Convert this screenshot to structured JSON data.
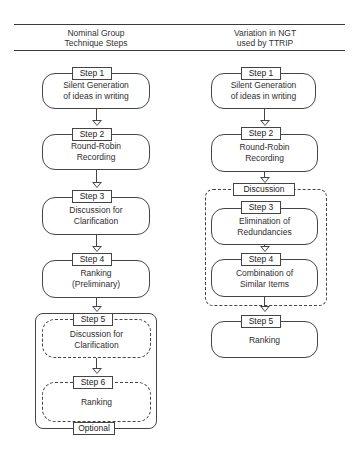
{
  "headers": {
    "left": [
      "Nominal Group",
      "Technique Steps"
    ],
    "right": [
      "Variation in NGT",
      "used by TTRIP"
    ]
  },
  "left_column": {
    "steps": [
      {
        "label": "Step 1",
        "text": [
          "Silent Generation",
          "of ideas in writing"
        ]
      },
      {
        "label": "Step 2",
        "text": [
          "Round-Robin",
          "Recording"
        ]
      },
      {
        "label": "Step 3",
        "text": [
          "Discussion for",
          "Clarification"
        ]
      },
      {
        "label": "Step 4",
        "text": [
          "Ranking",
          "(Preliminary)"
        ]
      },
      {
        "label": "Step 5",
        "text": [
          "Discussion for",
          "Clarification"
        ]
      },
      {
        "label": "Step 6",
        "text": [
          "Ranking"
        ]
      }
    ],
    "group": {
      "label": "Optional",
      "contains": [
        "Step 5",
        "Step 6"
      ]
    }
  },
  "right_column": {
    "steps": [
      {
        "label": "Step 1",
        "text": [
          "Silent Generation",
          "of ideas in writing"
        ]
      },
      {
        "label": "Step 2",
        "text": [
          "Round-Robin",
          "Recording"
        ]
      },
      {
        "label": "Step 3",
        "text": [
          "Elimination of",
          "Redundancies"
        ]
      },
      {
        "label": "Step 4",
        "text": [
          "Combination of",
          "Similar Items"
        ]
      },
      {
        "label": "Step 5",
        "text": [
          "Ranking"
        ]
      }
    ],
    "group": {
      "label": "Discussion",
      "contains": [
        "Step 3",
        "Step 4"
      ]
    }
  }
}
